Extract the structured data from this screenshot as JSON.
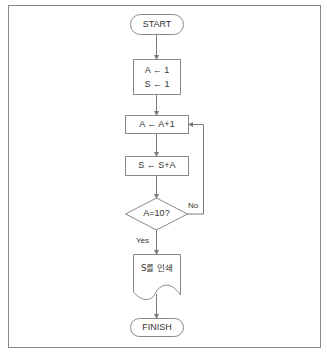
{
  "diagram": {
    "type": "flowchart",
    "colors": {
      "line": "#7a7a7a",
      "text": "#333333",
      "frame": "#8a8a8a",
      "background": "#ffffff"
    },
    "nodes": [
      {
        "id": "start",
        "shape": "terminal",
        "label": "START"
      },
      {
        "id": "init",
        "shape": "process",
        "lines": [
          "A ← 1",
          "S ← 1"
        ]
      },
      {
        "id": "incA",
        "shape": "process",
        "label": "A ← A+1"
      },
      {
        "id": "addS",
        "shape": "process",
        "label": "S ← S+A"
      },
      {
        "id": "check",
        "shape": "decision",
        "label": "A=10?"
      },
      {
        "id": "print",
        "shape": "document",
        "label": "S를 인쇄"
      },
      {
        "id": "finish",
        "shape": "terminal",
        "label": "FINISH"
      }
    ],
    "edges": [
      {
        "from": "start",
        "to": "init"
      },
      {
        "from": "init",
        "to": "incA"
      },
      {
        "from": "incA",
        "to": "addS"
      },
      {
        "from": "addS",
        "to": "check"
      },
      {
        "from": "check",
        "to": "print",
        "label": "Yes"
      },
      {
        "from": "check",
        "to": "incA",
        "label": "No"
      },
      {
        "from": "print",
        "to": "finish"
      }
    ]
  }
}
